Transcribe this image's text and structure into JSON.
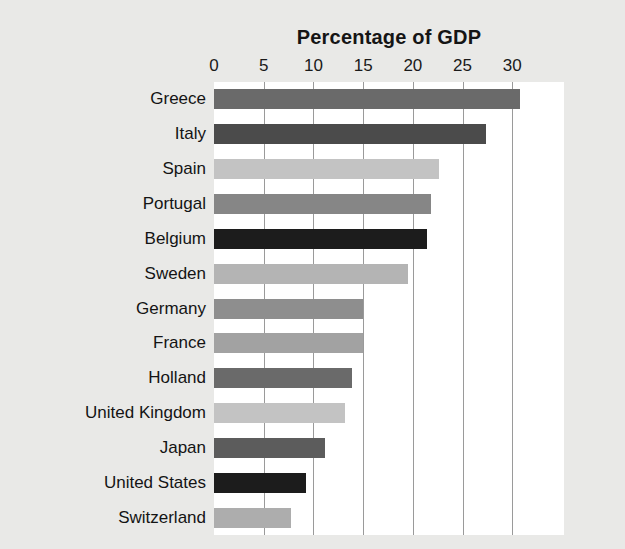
{
  "chart_data": {
    "type": "bar",
    "orientation": "horizontal",
    "title": "Percentage of GDP",
    "xlabel": "",
    "ylabel": "",
    "xlim": [
      0,
      35.2
    ],
    "xticks": [
      0,
      5,
      10,
      15,
      20,
      25,
      30
    ],
    "xtick_labels": [
      "0",
      "5",
      "10",
      "15",
      "20",
      "25",
      "30"
    ],
    "grid": "vertical-only",
    "legend": "none",
    "background_color": "#e9e9e7",
    "plot_background_color": "#ffffff",
    "gridline_color": "#9a9a9a",
    "categories": [
      "Greece",
      "Italy",
      "Spain",
      "Portugal",
      "Belgium",
      "Sweden",
      "Germany",
      "France",
      "Holland",
      "United Kingdom",
      "Japan",
      "United States",
      "Switzerland"
    ],
    "values": [
      30.8,
      27.4,
      22.6,
      21.8,
      21.4,
      19.5,
      15.0,
      15.0,
      13.9,
      13.2,
      11.2,
      9.3,
      7.7
    ],
    "bar_colors": [
      "#6a6a6a",
      "#4b4b4b",
      "#c3c3c3",
      "#868686",
      "#1c1c1c",
      "#b4b4b4",
      "#8e8e8e",
      "#a2a2a2",
      "#6a6a6a",
      "#c3c3c3",
      "#5c5c5c",
      "#1c1c1c",
      "#adadad"
    ]
  }
}
